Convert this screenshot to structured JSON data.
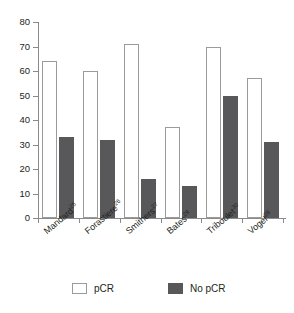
{
  "chart_data": {
    "type": "bar",
    "title": "",
    "subtitle": "",
    "xlabel": "",
    "ylabel": "",
    "ylim": [
      0,
      80
    ],
    "yticks": [
      0,
      10,
      20,
      30,
      40,
      50,
      60,
      70,
      80
    ],
    "grid": false,
    "legend_position": "bottom",
    "categories": [
      "Mandard",
      "Forastiere",
      "Smithers",
      "Bates",
      "Triboulet",
      "Vogel"
    ],
    "category_superscripts": [
      "25",
      "26",
      "27",
      "29",
      "30",
      "28"
    ],
    "series": [
      {
        "name": "pCR",
        "color": "#ffffff",
        "values": [
          64,
          60,
          71,
          37,
          70,
          57
        ]
      },
      {
        "name": "No pCR",
        "color": "#58585a",
        "values": [
          33,
          32,
          16,
          13,
          50,
          31
        ]
      }
    ]
  },
  "legend": {
    "items": [
      {
        "label": "pCR",
        "swatch": "open-square-swatch"
      },
      {
        "label": "No pCR",
        "swatch": "filled-square-swatch"
      }
    ]
  },
  "axes": {
    "y_tick_labels": [
      "80",
      "70",
      "60",
      "50",
      "40",
      "30",
      "20",
      "10",
      "0"
    ]
  }
}
